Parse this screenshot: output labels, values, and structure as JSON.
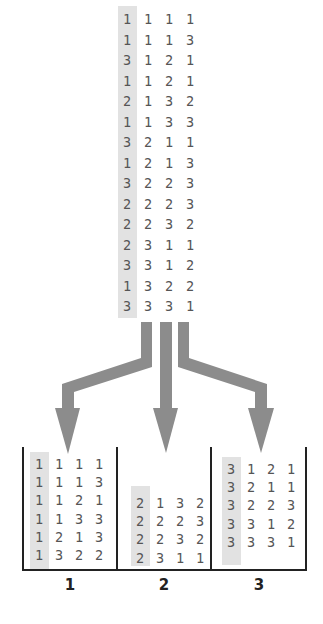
{
  "source_table": {
    "highlight_column": 0,
    "rows": [
      [
        "1",
        "1",
        "1",
        "1"
      ],
      [
        "1",
        "1",
        "1",
        "3"
      ],
      [
        "3",
        "1",
        "2",
        "1"
      ],
      [
        "1",
        "1",
        "2",
        "1"
      ],
      [
        "2",
        "1",
        "3",
        "2"
      ],
      [
        "1",
        "1",
        "3",
        "3"
      ],
      [
        "3",
        "2",
        "1",
        "1"
      ],
      [
        "1",
        "2",
        "1",
        "3"
      ],
      [
        "3",
        "2",
        "2",
        "3"
      ],
      [
        "2",
        "2",
        "2",
        "3"
      ],
      [
        "2",
        "2",
        "3",
        "2"
      ],
      [
        "2",
        "3",
        "1",
        "1"
      ],
      [
        "3",
        "3",
        "1",
        "2"
      ],
      [
        "1",
        "3",
        "2",
        "2"
      ],
      [
        "3",
        "3",
        "3",
        "1"
      ]
    ]
  },
  "arrows": [
    {
      "target_bin": "1",
      "color": "#8c8c8c"
    },
    {
      "target_bin": "2",
      "color": "#8c8c8c"
    },
    {
      "target_bin": "3",
      "color": "#8c8c8c"
    }
  ],
  "bins": [
    {
      "label": "1",
      "rows": [
        [
          "1",
          "1",
          "1",
          "1"
        ],
        [
          "1",
          "1",
          "1",
          "3"
        ],
        [
          "1",
          "1",
          "2",
          "1"
        ],
        [
          "1",
          "1",
          "3",
          "3"
        ],
        [
          "1",
          "2",
          "1",
          "3"
        ],
        [
          "1",
          "3",
          "2",
          "2"
        ]
      ]
    },
    {
      "label": "2",
      "rows": [
        [
          "2",
          "1",
          "3",
          "2"
        ],
        [
          "2",
          "2",
          "2",
          "3"
        ],
        [
          "2",
          "2",
          "3",
          "2"
        ],
        [
          "2",
          "3",
          "1",
          "1"
        ]
      ]
    },
    {
      "label": "3",
      "rows": [
        [
          "3",
          "1",
          "2",
          "1"
        ],
        [
          "3",
          "2",
          "1",
          "1"
        ],
        [
          "3",
          "2",
          "2",
          "3"
        ],
        [
          "3",
          "3",
          "1",
          "2"
        ],
        [
          "3",
          "3",
          "3",
          "1"
        ]
      ]
    }
  ],
  "colors": {
    "highlight": "#e2e2e2",
    "arrow": "#8c8c8c",
    "text": "#555555",
    "lines": "#222222"
  }
}
